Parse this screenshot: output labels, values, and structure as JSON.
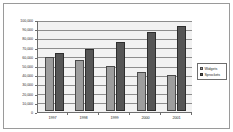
{
  "chart_data": {
    "type": "bar",
    "title": "",
    "xlabel": "",
    "ylabel": "",
    "categories": [
      "1997",
      "1998",
      "1999",
      "2000",
      "2001"
    ],
    "series": [
      {
        "name": "Widgets",
        "color": "#9d9d9d",
        "values": [
          60000,
          57000,
          50000,
          43000,
          39500
        ]
      },
      {
        "name": "Sprockets",
        "color": "#565656",
        "values": [
          64000,
          69000,
          77000,
          88000,
          94000
        ]
      }
    ],
    "ylim": [
      0,
      100000
    ],
    "ytick_values": [
      0,
      10000,
      20000,
      30000,
      40000,
      50000,
      60000,
      70000,
      80000,
      90000,
      100000
    ],
    "ytick_labels": [
      "0",
      "10,000",
      "20,000",
      "30,000",
      "40,000",
      "50,000",
      "60,000",
      "70,000",
      "80,000",
      "90,000",
      "100,000"
    ],
    "grid": true,
    "legend_position": "right"
  },
  "legend": {
    "entries": [
      {
        "label": "Widgets"
      },
      {
        "label": "Sprockets"
      }
    ]
  }
}
